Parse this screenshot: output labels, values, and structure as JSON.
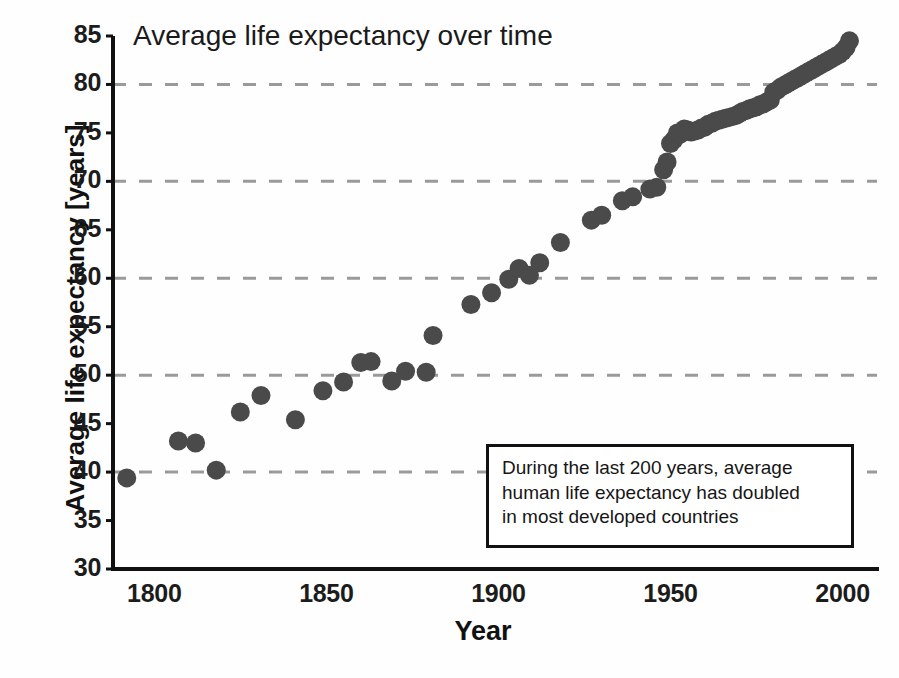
{
  "chart_data": {
    "type": "scatter",
    "title": "Average life expectancy over time",
    "xlabel": "Year",
    "ylabel": "Average life expectancy [years]",
    "xlim": [
      1788,
      2010
    ],
    "ylim": [
      30,
      85
    ],
    "xticks": [
      1800,
      1850,
      1900,
      1950,
      2000
    ],
    "yticks": [
      30,
      35,
      40,
      45,
      50,
      55,
      60,
      65,
      70,
      75,
      80,
      85
    ],
    "gridlines_y": [
      40,
      50,
      60,
      70,
      80
    ],
    "grid": "horizontal-dashed",
    "legend": "none",
    "marker": "filled-circle",
    "marker_color": "#4a4a4a",
    "marker_size_px": 19,
    "series": [
      {
        "name": "Average life expectancy",
        "points": [
          [
            1792,
            39.4
          ],
          [
            1807,
            43.2
          ],
          [
            1812,
            43.0
          ],
          [
            1818,
            40.2
          ],
          [
            1825,
            46.2
          ],
          [
            1831,
            47.9
          ],
          [
            1841,
            45.4
          ],
          [
            1849,
            48.4
          ],
          [
            1855,
            49.3
          ],
          [
            1860,
            51.3
          ],
          [
            1863,
            51.4
          ],
          [
            1869,
            49.4
          ],
          [
            1873,
            50.4
          ],
          [
            1879,
            50.3
          ],
          [
            1881,
            54.1
          ],
          [
            1892,
            57.3
          ],
          [
            1898,
            58.5
          ],
          [
            1903,
            59.9
          ],
          [
            1906,
            61.0
          ],
          [
            1909,
            60.3
          ],
          [
            1912,
            61.6
          ],
          [
            1918,
            63.7
          ],
          [
            1927,
            66.0
          ],
          [
            1930,
            66.5
          ],
          [
            1936,
            68.0
          ],
          [
            1939,
            68.4
          ],
          [
            1944,
            69.2
          ],
          [
            1946,
            69.4
          ],
          [
            1948,
            71.2
          ],
          [
            1949,
            72.0
          ],
          [
            1950,
            73.9
          ],
          [
            1951,
            74.3
          ],
          [
            1952,
            75.0
          ],
          [
            1953,
            74.9
          ],
          [
            1954,
            75.4
          ],
          [
            1955,
            75.3
          ],
          [
            1956,
            75.1
          ],
          [
            1957,
            75.2
          ],
          [
            1958,
            75.3
          ],
          [
            1959,
            75.5
          ],
          [
            1960,
            75.6
          ],
          [
            1961,
            75.9
          ],
          [
            1962,
            76.0
          ],
          [
            1963,
            76.2
          ],
          [
            1964,
            76.3
          ],
          [
            1965,
            76.4
          ],
          [
            1966,
            76.5
          ],
          [
            1967,
            76.6
          ],
          [
            1968,
            76.7
          ],
          [
            1969,
            76.8
          ],
          [
            1970,
            77.0
          ],
          [
            1971,
            77.2
          ],
          [
            1972,
            77.3
          ],
          [
            1973,
            77.5
          ],
          [
            1974,
            77.6
          ],
          [
            1975,
            77.7
          ],
          [
            1976,
            77.9
          ],
          [
            1977,
            78.0
          ],
          [
            1978,
            78.2
          ],
          [
            1979,
            78.4
          ],
          [
            1980,
            79.2
          ],
          [
            1981,
            79.4
          ],
          [
            1982,
            79.7
          ],
          [
            1983,
            79.9
          ],
          [
            1984,
            80.1
          ],
          [
            1985,
            80.3
          ],
          [
            1986,
            80.5
          ],
          [
            1987,
            80.7
          ],
          [
            1988,
            80.9
          ],
          [
            1989,
            81.1
          ],
          [
            1990,
            81.3
          ],
          [
            1991,
            81.5
          ],
          [
            1992,
            81.7
          ],
          [
            1993,
            81.9
          ],
          [
            1994,
            82.1
          ],
          [
            1995,
            82.3
          ],
          [
            1996,
            82.5
          ],
          [
            1997,
            82.7
          ],
          [
            1998,
            82.9
          ],
          [
            1999,
            83.1
          ],
          [
            2000,
            83.4
          ],
          [
            2001,
            83.8
          ],
          [
            2002,
            84.5
          ]
        ]
      }
    ],
    "annotation": {
      "text": "During the last 200 years, average\nhuman life expectancy has doubled\nin most developed countries"
    }
  }
}
